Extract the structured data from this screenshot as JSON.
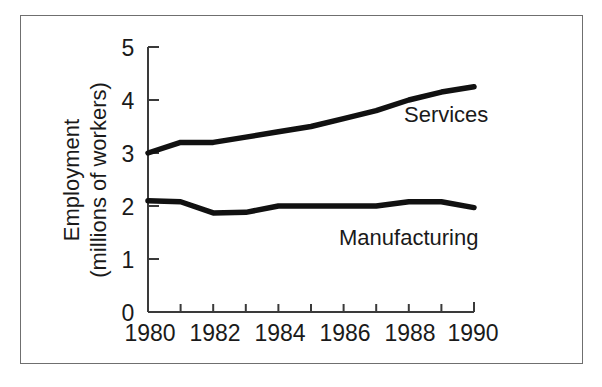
{
  "chart_data": {
    "type": "line",
    "title": "",
    "subtitle": "",
    "xlabel": "",
    "ylabel": "Employment (millions of workers)",
    "ylabel_line1": "Employment",
    "ylabel_line2": "(millions of workers)",
    "x": [
      1980,
      1981,
      1982,
      1983,
      1984,
      1985,
      1986,
      1987,
      1988,
      1989,
      1990
    ],
    "xlim": [
      1980,
      1990
    ],
    "ylim": [
      0,
      5
    ],
    "xticks": [
      1980,
      1981,
      1982,
      1983,
      1984,
      1985,
      1986,
      1987,
      1988,
      1989,
      1990
    ],
    "xtick_labels": [
      "1980",
      "",
      "1982",
      "",
      "1984",
      "",
      "1986",
      "",
      "1988",
      "",
      "1990"
    ],
    "xtick_labels_shown": [
      "1980",
      "1982",
      "1984",
      "1986",
      "1988",
      "1990"
    ],
    "yticks": [
      0,
      1,
      2,
      3,
      4,
      5
    ],
    "ytick_labels": [
      "0",
      "1",
      "2",
      "3",
      "4",
      "5"
    ],
    "grid": false,
    "legend": "inline-labels",
    "series": [
      {
        "name": "Services",
        "label": "Services",
        "color": "#111111",
        "values": [
          3.0,
          3.2,
          3.2,
          3.3,
          3.4,
          3.5,
          3.65,
          3.8,
          4.0,
          4.15,
          4.25
        ]
      },
      {
        "name": "Manufacturing",
        "label": "Manufacturing",
        "color": "#111111",
        "values": [
          2.1,
          2.08,
          1.87,
          1.88,
          2.0,
          2.0,
          2.0,
          2.0,
          2.08,
          2.08,
          1.97
        ]
      }
    ],
    "annotations": [
      {
        "text": "Services",
        "x": 1988.2,
        "y": 3.95
      },
      {
        "text": "Manufacturing",
        "x": 1985.6,
        "y": 1.55
      }
    ]
  },
  "colors": {
    "line": "#111111",
    "axis": "#3a3a3a",
    "frame": "#6f6f6f",
    "background": "#ffffff",
    "text": "#1a1a1a"
  }
}
